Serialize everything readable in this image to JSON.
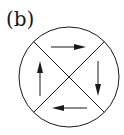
{
  "figure": {
    "label": "(b)",
    "colors": {
      "stroke": "#1a1a1a",
      "background": "#ffffff"
    },
    "circle": {
      "cx": 69,
      "cy": 77,
      "r": 50
    },
    "arrows": [
      {
        "name": "top-arrow",
        "direction": "right"
      },
      {
        "name": "right-arrow",
        "direction": "down"
      },
      {
        "name": "bottom-arrow",
        "direction": "left"
      },
      {
        "name": "left-arrow",
        "direction": "up"
      }
    ]
  }
}
